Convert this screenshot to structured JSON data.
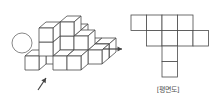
{
  "diagram": {
    "stroke_color": "#4a4a4a",
    "plan_label": "[평면도]",
    "plan_grid": {
      "cell_size": 15.5,
      "origin": [
        131,
        15
      ],
      "cells": [
        [
          0,
          0
        ],
        [
          1,
          0
        ],
        [
          2,
          0
        ],
        [
          3,
          0
        ],
        [
          1,
          1
        ],
        [
          2,
          1
        ],
        [
          3,
          1
        ],
        [
          4,
          1
        ],
        [
          2,
          2
        ],
        [
          2,
          3
        ]
      ]
    },
    "arrows": [
      {
        "name": "right-arrow",
        "from": [
          103,
          49
        ],
        "to": [
          122,
          49
        ]
      },
      {
        "name": "view-arrow",
        "from": [
          38,
          90
        ],
        "to": [
          46,
          78
        ]
      }
    ],
    "observer": {
      "name": "eye-circle",
      "cx": 22,
      "cy": 43,
      "r": 10
    }
  }
}
